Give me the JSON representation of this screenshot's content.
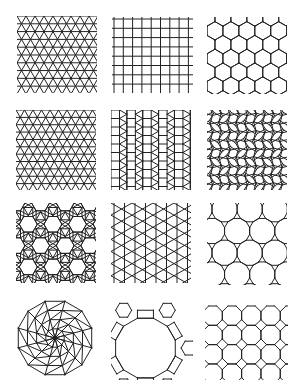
{
  "figure": {
    "background": "#ffffff",
    "stroke": "#222222",
    "layout": {
      "rows": 4,
      "cols": 3
    },
    "panels": [
      {
        "id": "triangular",
        "name": "Triangular tiling (3.3.3.3.3.3)",
        "x": 17,
        "y": 16,
        "w": 80,
        "h": 77,
        "cell": 9
      },
      {
        "id": "square",
        "name": "Square tiling (4.4.4.4)",
        "x": 112,
        "y": 17,
        "w": 81,
        "h": 76,
        "cell": 9.3
      },
      {
        "id": "hexagonal",
        "name": "Hexagonal tiling (6.6.6)",
        "x": 207,
        "y": 17,
        "w": 80,
        "h": 77,
        "cell": 9.2
      },
      {
        "id": "snub-hexagonal",
        "name": "Snub hexagonal tiling (3.3.3.3.6)",
        "x": 16,
        "y": 110,
        "w": 80,
        "h": 80,
        "cell": 8.5
      },
      {
        "id": "elongated-triangular",
        "name": "Elongated triangular tiling (3.3.3.4.4)",
        "x": 111,
        "y": 110,
        "w": 80,
        "h": 80,
        "cell": 8.5
      },
      {
        "id": "snub-square",
        "name": "Snub square tiling (3.3.4.3.4)",
        "x": 207,
        "y": 110,
        "w": 80,
        "h": 80,
        "cell": 9
      },
      {
        "id": "rhombitrihexagonal",
        "name": "Rhombitrihexagonal tiling (3.4.6.4)",
        "x": 16,
        "y": 203,
        "w": 80,
        "h": 80,
        "cell": 9
      },
      {
        "id": "trihexagonal",
        "name": "Trihexagonal tiling (3.6.3.6)",
        "x": 111,
        "y": 203,
        "w": 80,
        "h": 80,
        "cell": 10.5
      },
      {
        "id": "truncated-hexagonal",
        "name": "Truncated hexagonal tiling (3.12.12)",
        "x": 207,
        "y": 203,
        "w": 80,
        "h": 82,
        "cell": 13
      },
      {
        "id": "radial-dodecagon",
        "name": "Radial 12-fold dissection",
        "x": 15,
        "y": 298,
        "w": 80,
        "h": 80,
        "cell": 38
      },
      {
        "id": "truncated-trihexagonal",
        "name": "Truncated trihexagonal tiling (4.6.12)",
        "x": 111,
        "y": 296,
        "w": 82,
        "h": 84,
        "cell": 8
      },
      {
        "id": "truncated-square",
        "name": "Truncated square tiling (4.8.8)",
        "x": 205,
        "y": 300,
        "w": 83,
        "h": 80,
        "cell": 8
      }
    ]
  }
}
